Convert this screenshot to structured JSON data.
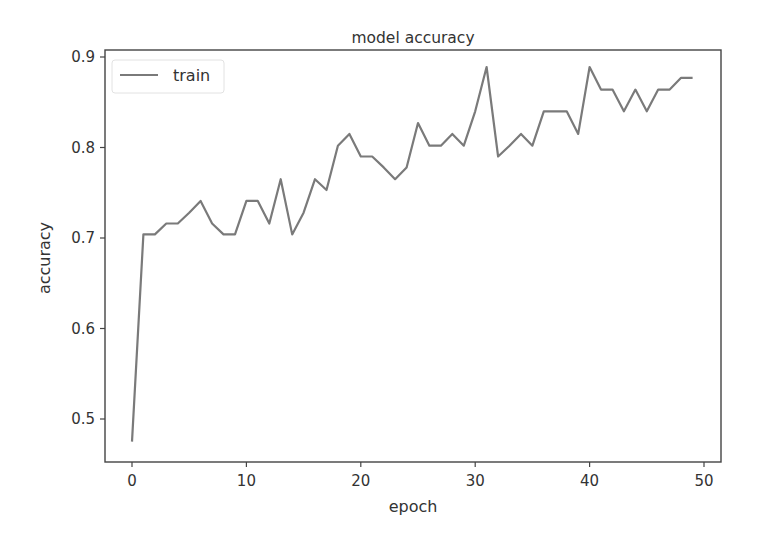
{
  "chart_data": {
    "type": "line",
    "title": "model accuracy",
    "xlabel": "epoch",
    "ylabel": "accuracy",
    "xlim": [
      -2.5,
      51.5
    ],
    "ylim": [
      0.452,
      0.908
    ],
    "xticks": [
      0,
      10,
      20,
      30,
      40,
      50
    ],
    "xtick_labels": [
      "0",
      "10",
      "20",
      "30",
      "40",
      "50"
    ],
    "yticks": [
      0.5,
      0.6,
      0.7,
      0.8,
      0.9
    ],
    "ytick_labels": [
      "0.5",
      "0.6",
      "0.7",
      "0.8",
      "0.9"
    ],
    "grid": false,
    "legend": {
      "position": "upper left",
      "entries": [
        "train"
      ]
    },
    "series": [
      {
        "name": "train",
        "color": "#7a7a7a",
        "x": [
          0,
          1,
          2,
          3,
          4,
          5,
          6,
          7,
          8,
          9,
          10,
          11,
          12,
          13,
          14,
          15,
          16,
          17,
          18,
          19,
          20,
          21,
          22,
          23,
          24,
          25,
          26,
          27,
          28,
          29,
          30,
          31,
          32,
          33,
          34,
          35,
          36,
          37,
          38,
          39,
          40,
          41,
          42,
          43,
          44,
          45,
          46,
          47,
          48,
          49
        ],
        "values": [
          0.475,
          0.704,
          0.704,
          0.716,
          0.716,
          0.728,
          0.741,
          0.716,
          0.704,
          0.704,
          0.741,
          0.741,
          0.716,
          0.765,
          0.704,
          0.728,
          0.765,
          0.753,
          0.802,
          0.815,
          0.79,
          0.79,
          0.778,
          0.765,
          0.778,
          0.827,
          0.802,
          0.802,
          0.815,
          0.802,
          0.84,
          0.889,
          0.79,
          0.802,
          0.815,
          0.802,
          0.84,
          0.84,
          0.84,
          0.815,
          0.889,
          0.864,
          0.864,
          0.84,
          0.864,
          0.84,
          0.864,
          0.864,
          0.877,
          0.877
        ]
      }
    ]
  },
  "labels": {
    "title": "model accuracy",
    "xlabel": "epoch",
    "ylabel": "accuracy",
    "legend_train": "train"
  }
}
